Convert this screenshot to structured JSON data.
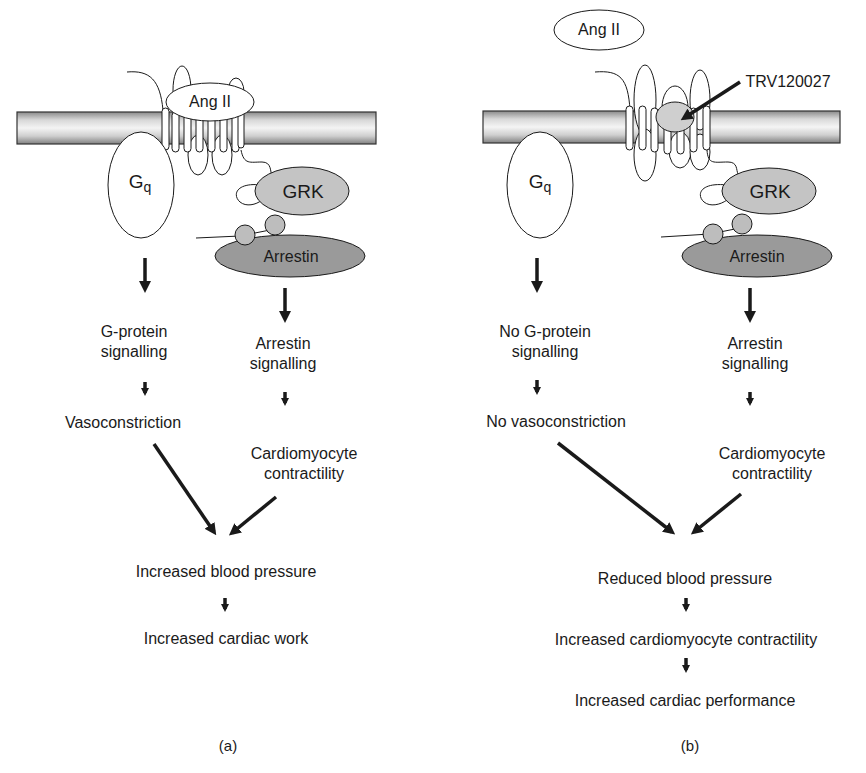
{
  "panels": [
    {
      "id": "a",
      "caption": "(a)",
      "ligand_bound": "Ang II",
      "g_protein": "G",
      "g_protein_sub": "q",
      "kinase": "GRK",
      "arrestin": "Arrestin",
      "g_path": [
        "G-protein",
        "signalling",
        "Vasoconstriction"
      ],
      "arrestin_path": [
        "Arrestin",
        "signalling",
        "Cardiomyocyte",
        "contractility"
      ],
      "outcomes": [
        "Increased blood pressure",
        "Increased cardiac work"
      ]
    },
    {
      "id": "b",
      "caption": "(b)",
      "ligand_free": "Ang II",
      "drug": "TRV120027",
      "g_protein": "G",
      "g_protein_sub": "q",
      "kinase": "GRK",
      "arrestin": "Arrestin",
      "g_path": [
        "No G-protein",
        "signalling",
        "No vasoconstriction"
      ],
      "arrestin_path": [
        "Arrestin",
        "signalling",
        "Cardiomyocyte",
        "contractility"
      ],
      "outcomes": [
        "Reduced blood pressure",
        "Increased cardiomyocyte contractility",
        "Increased cardiac performance"
      ]
    }
  ],
  "colors": {
    "grk_fill": "#c4c4c4",
    "arrestin_fill": "#9a9a9a",
    "phospho_fill": "#bdbdbd",
    "drug_fill": "#cfcfcf",
    "stroke": "#1a1a1a"
  }
}
